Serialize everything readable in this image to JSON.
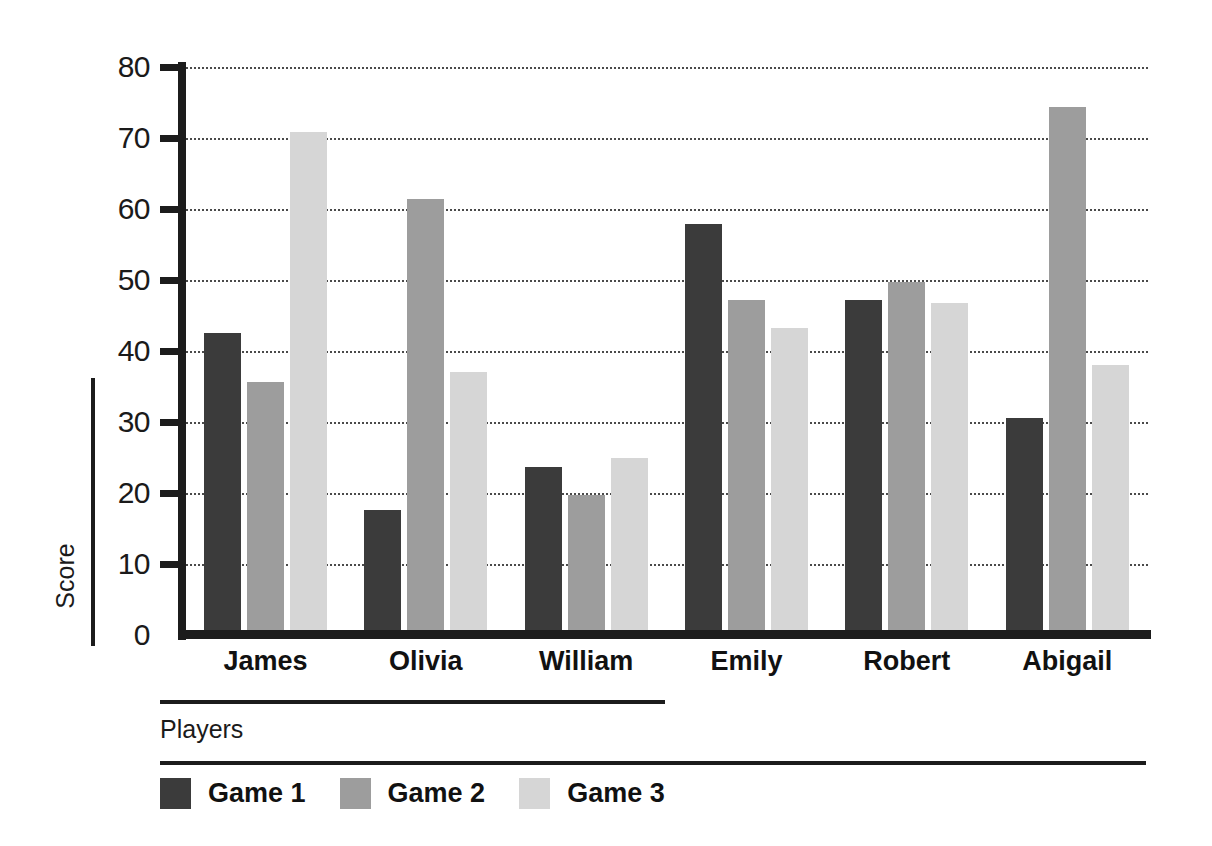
{
  "chart_data": {
    "type": "bar",
    "title": "",
    "subtitle": "",
    "xlabel": "Players",
    "ylabel": "Score",
    "categories": [
      "James",
      "Olivia",
      "William",
      "Emily",
      "Robert",
      "Abigail"
    ],
    "series": [
      {
        "name": "Game 1",
        "color": "#3b3b3b",
        "values": [
          42.5,
          17.6,
          23.7,
          57.9,
          47.2,
          30.6
        ]
      },
      {
        "name": "Game 2",
        "color": "#9d9d9d",
        "values": [
          35.6,
          61.4,
          19.7,
          47.2,
          49.7,
          74.4
        ]
      },
      {
        "name": "Game 3",
        "color": "#d6d6d6",
        "values": [
          70.8,
          37.0,
          25.0,
          43.3,
          46.8,
          38.1
        ]
      }
    ],
    "ylim": [
      0,
      80
    ],
    "ytick_step": 10,
    "yticks": [
      0,
      10,
      20,
      30,
      40,
      50,
      60,
      70,
      80
    ],
    "ytick_labels": [
      "0",
      "10",
      "20",
      "30",
      "40",
      "50",
      "60",
      "70",
      "80"
    ],
    "grid": "horizontal-dotted",
    "grid_color": "#4a4a4a",
    "axis_color": "#1c1c1c",
    "background": "#ffffff",
    "legend_position": "bottom-left",
    "orientation": "vertical",
    "grouping": "grouped"
  }
}
